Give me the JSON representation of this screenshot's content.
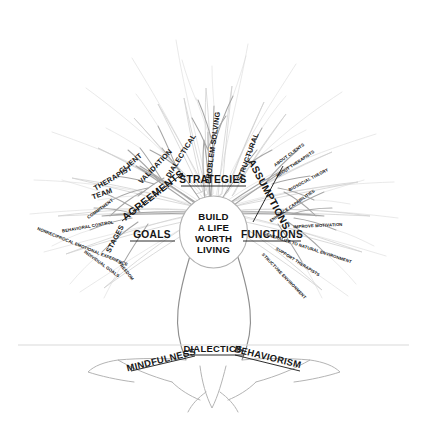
{
  "diagram": {
    "core": {
      "name": "core-oval",
      "lines": [
        "BUILD",
        "A LIFE",
        "WORTH",
        "LIVING"
      ]
    },
    "colors": {
      "ink": "#151515",
      "branch_near": "#9a9a9a",
      "branch_mid": "#bdbdbd",
      "branch_far": "#dcdcdc",
      "trunk": "#8f8f8f",
      "ground": "#d5d5d5",
      "background": "#ffffff"
    },
    "branches": [
      {
        "id": "strategies",
        "label": "STRATEGIES",
        "children": [
          "DIALECTICAL",
          "PROBLEM SOLVING",
          "STRUCTURAL",
          "VALIDATION"
        ]
      },
      {
        "id": "assumptions",
        "label": "ASSUMPTIONS",
        "children": [
          "ABOUT CLIENTS",
          "ABOUT THERAPISTS",
          "BIOSOCIAL THEORY"
        ]
      },
      {
        "id": "functions",
        "label": "FUNCTIONS",
        "children": [
          "ENHANCE CAPABILITIES",
          "IMPROVE MOTIVATION",
          "GENERALIZE TO NATURAL ENVIRONMENT",
          "SUPPORT THERAPISTS",
          "STRUCTURE ENVIRONMENT"
        ]
      },
      {
        "id": "goals",
        "label": "GOALS",
        "children": [
          "STAGES"
        ],
        "grandchildren": [
          "COMMITMENT",
          "BEHAVIORAL CONTROL",
          "NONRECIPROCAL EMOTIONAL EXPERIENCE",
          "INDIVIDUAL GOALS",
          "FREEDOM"
        ]
      },
      {
        "id": "agreements",
        "label": "AGREEMENTS",
        "children": [
          "CLIENT",
          "THERAPIST",
          "TEAM"
        ]
      }
    ],
    "roots": {
      "name": "roots",
      "labels": [
        "MINDFULNESS",
        "DIALECTICS",
        "BEHAVIORISM"
      ]
    }
  }
}
